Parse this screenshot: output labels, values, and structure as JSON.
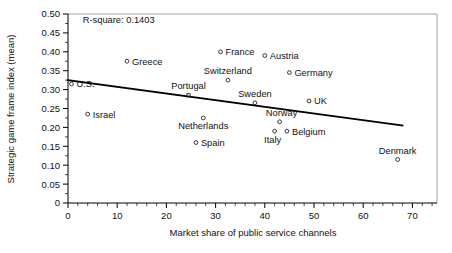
{
  "chart_data": {
    "type": "scatter",
    "title": "",
    "xlabel": "Market share of public service channels",
    "ylabel": "Strategic game frame index (mean)",
    "xlim": [
      0,
      75
    ],
    "ylim": [
      0,
      0.5
    ],
    "grid": false,
    "legend": "none",
    "annotations": [
      {
        "name": "r-square",
        "text": "R-square: 0.1403",
        "x": 3,
        "y": 0.475
      }
    ],
    "xticks": [
      0,
      10,
      20,
      30,
      40,
      50,
      60,
      70
    ],
    "xtick_labels": [
      "0",
      "10",
      "20",
      "30",
      "40",
      "50",
      "60",
      "70"
    ],
    "xtick_minor_step": 2,
    "yticks": [
      0,
      0.05,
      0.1,
      0.15,
      0.2,
      0.25,
      0.3,
      0.35,
      0.4,
      0.45,
      0.5
    ],
    "ytick_labels": [
      "0",
      "0.05",
      "0.10",
      "0.15",
      "0.20",
      "0.25",
      "0.30",
      "0.35",
      "0.40",
      "0.45",
      "0.50"
    ],
    "points": [
      {
        "label": "U.S.",
        "x": 0.7,
        "y": 0.315,
        "marker": "circle",
        "label_dx": 5,
        "label_dy": 3.5,
        "anchor": "start"
      },
      {
        "label": "Israel",
        "x": 4.0,
        "y": 0.235,
        "marker": "circle",
        "label_dx": 5,
        "label_dy": 3.5,
        "anchor": "start"
      },
      {
        "label": "Greece",
        "x": 12.0,
        "y": 0.375,
        "marker": "circle",
        "label_dx": 5,
        "label_dy": 3.5,
        "anchor": "start"
      },
      {
        "label": "Portugal",
        "x": 24.5,
        "y": 0.285,
        "marker": "square",
        "label_dx": 0,
        "label_dy": -6,
        "anchor": "middle"
      },
      {
        "label": "Spain",
        "x": 26.0,
        "y": 0.16,
        "marker": "circle",
        "label_dx": 5,
        "label_dy": 3.5,
        "anchor": "start"
      },
      {
        "label": "Netherlands",
        "x": 27.5,
        "y": 0.225,
        "marker": "circle",
        "label_dx": 0,
        "label_dy": 11,
        "anchor": "middle"
      },
      {
        "label": "France",
        "x": 31.0,
        "y": 0.4,
        "marker": "circle",
        "label_dx": 5,
        "label_dy": 3.5,
        "anchor": "start"
      },
      {
        "label": "Switzerland",
        "x": 32.5,
        "y": 0.325,
        "marker": "circle",
        "label_dx": 0,
        "label_dy": -6,
        "anchor": "middle"
      },
      {
        "label": "Sweden",
        "x": 38.0,
        "y": 0.265,
        "marker": "circle",
        "label_dx": 0,
        "label_dy": -6,
        "anchor": "middle"
      },
      {
        "label": "Austria",
        "x": 40.0,
        "y": 0.39,
        "marker": "circle",
        "label_dx": 5,
        "label_dy": 3.5,
        "anchor": "start"
      },
      {
        "label": "Italy",
        "x": 42.0,
        "y": 0.19,
        "marker": "circle",
        "label_dx": -2,
        "label_dy": 12,
        "anchor": "middle"
      },
      {
        "label": "Norway",
        "x": 43.0,
        "y": 0.215,
        "marker": "circle",
        "label_dx": 2,
        "label_dy": -6,
        "anchor": "middle"
      },
      {
        "label": "Belgium",
        "x": 44.5,
        "y": 0.19,
        "marker": "circle",
        "label_dx": 5,
        "label_dy": 3.5,
        "anchor": "start"
      },
      {
        "label": "Germany",
        "x": 45.0,
        "y": 0.345,
        "marker": "circle",
        "label_dx": 5,
        "label_dy": 3.5,
        "anchor": "start"
      },
      {
        "label": "UK",
        "x": 49.0,
        "y": 0.27,
        "marker": "circle",
        "label_dx": 5,
        "label_dy": 3.5,
        "anchor": "start"
      },
      {
        "label": "Denmark",
        "x": 67.0,
        "y": 0.115,
        "marker": "circle",
        "label_dx": 0,
        "label_dy": -6,
        "anchor": "middle"
      }
    ],
    "fit_line": {
      "name": "regression-line",
      "x0": 0.0,
      "y0": 0.325,
      "x1": 68.0,
      "y1": 0.205
    }
  }
}
